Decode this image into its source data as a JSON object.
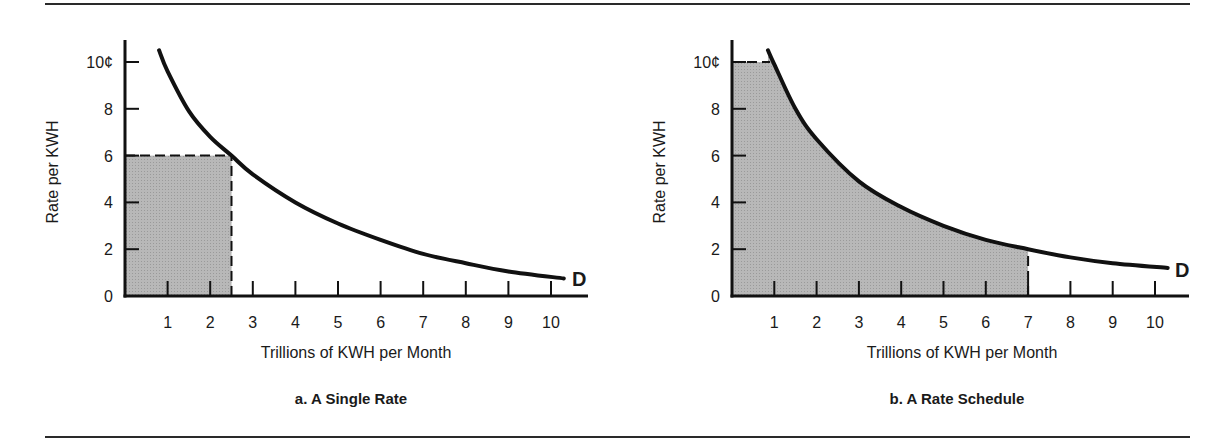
{
  "figure": {
    "charts": [
      {
        "id": "a",
        "caption": "a. A Single Rate",
        "ylabel": "Rate per KWH",
        "xlabel": "Trillions of KWH per Month",
        "curve_label": "D",
        "y_ticks": [
          "0",
          "2",
          "4",
          "6",
          "8",
          "10¢"
        ],
        "x_ticks": [
          "1",
          "2",
          "3",
          "4",
          "5",
          "6",
          "7",
          "8",
          "9",
          "10"
        ]
      },
      {
        "id": "b",
        "caption": "b. A Rate Schedule",
        "ylabel": "Rate per KWH",
        "xlabel": "Trillions of KWH per Month",
        "curve_label": "D",
        "y_ticks": [
          "0",
          "2",
          "4",
          "6",
          "8",
          "10¢"
        ],
        "x_ticks": [
          "1",
          "2",
          "3",
          "4",
          "5",
          "6",
          "7",
          "8",
          "9",
          "10"
        ]
      }
    ]
  },
  "colors": {
    "curve": "#111111",
    "shade": "#b4b4b4",
    "axis": "#111111",
    "rule": "#2a2a2a"
  },
  "chart_data": [
    {
      "type": "line",
      "title": "a. A Single Rate",
      "xlabel": "Trillions of KWH per Month",
      "ylabel": "Rate per KWH",
      "xlim": [
        0,
        10.8
      ],
      "ylim": [
        0,
        11
      ],
      "x_ticks": [
        1,
        2,
        3,
        4,
        5,
        6,
        7,
        8,
        9,
        10
      ],
      "y_ticks": [
        0,
        2,
        4,
        6,
        8,
        10
      ],
      "y_tick_labels": [
        "0",
        "2",
        "4",
        "6",
        "8",
        "10¢"
      ],
      "grid": false,
      "series": [
        {
          "name": "D (demand curve)",
          "x": [
            0.8,
            1.0,
            1.5,
            2.0,
            2.5,
            3.0,
            4.0,
            5.0,
            6.0,
            7.0,
            8.0,
            9.0,
            10.3
          ],
          "y": [
            10.5,
            9.6,
            7.9,
            6.8,
            6.0,
            5.2,
            4.0,
            3.1,
            2.4,
            1.8,
            1.4,
            1.05,
            0.75
          ]
        }
      ],
      "shaded_region": {
        "shape": "rectangle",
        "x": [
          0,
          2.5
        ],
        "y": [
          0,
          6
        ],
        "meaning": "revenue at single rate 6¢ × 2.5 trillion KWH"
      },
      "reference_lines": [
        {
          "orientation": "horizontal",
          "y": 6,
          "x_range": [
            0,
            2.5
          ],
          "style": "dashed"
        },
        {
          "orientation": "vertical",
          "x": 2.5,
          "y_range": [
            0,
            6
          ],
          "style": "dashed"
        }
      ],
      "annotations": [
        {
          "text": "D",
          "x": 10.5,
          "y": 0.8
        }
      ]
    },
    {
      "type": "area",
      "title": "b. A Rate Schedule",
      "xlabel": "Trillions of KWH per Month",
      "ylabel": "Rate per KWH",
      "xlim": [
        0,
        10.8
      ],
      "ylim": [
        0,
        11
      ],
      "x_ticks": [
        1,
        2,
        3,
        4,
        5,
        6,
        7,
        8,
        9,
        10
      ],
      "y_ticks": [
        0,
        2,
        4,
        6,
        8,
        10
      ],
      "y_tick_labels": [
        "0",
        "2",
        "4",
        "6",
        "8",
        "10¢"
      ],
      "grid": false,
      "series": [
        {
          "name": "D (demand curve)",
          "x": [
            0.85,
            1.0,
            1.5,
            2.0,
            3.0,
            4.0,
            5.0,
            6.0,
            7.0,
            8.0,
            9.0,
            10.3
          ],
          "y": [
            10.5,
            9.9,
            8.0,
            6.7,
            4.9,
            3.8,
            3.0,
            2.4,
            2.0,
            1.65,
            1.4,
            1.2
          ]
        }
      ],
      "shaded_region": {
        "shape": "area-under-curve",
        "x": [
          0,
          7
        ],
        "y_cap": 10,
        "meaning": "revenue under rate schedule up to 7 trillion KWH at 2¢"
      },
      "reference_lines": [
        {
          "orientation": "horizontal",
          "y": 10,
          "x_range": [
            0,
            0.9
          ],
          "style": "dashed"
        },
        {
          "orientation": "vertical",
          "x": 7,
          "y_range": [
            0,
            2
          ],
          "style": "dashed"
        }
      ],
      "annotations": [
        {
          "text": "D",
          "x": 10.5,
          "y": 1.2
        }
      ]
    }
  ]
}
